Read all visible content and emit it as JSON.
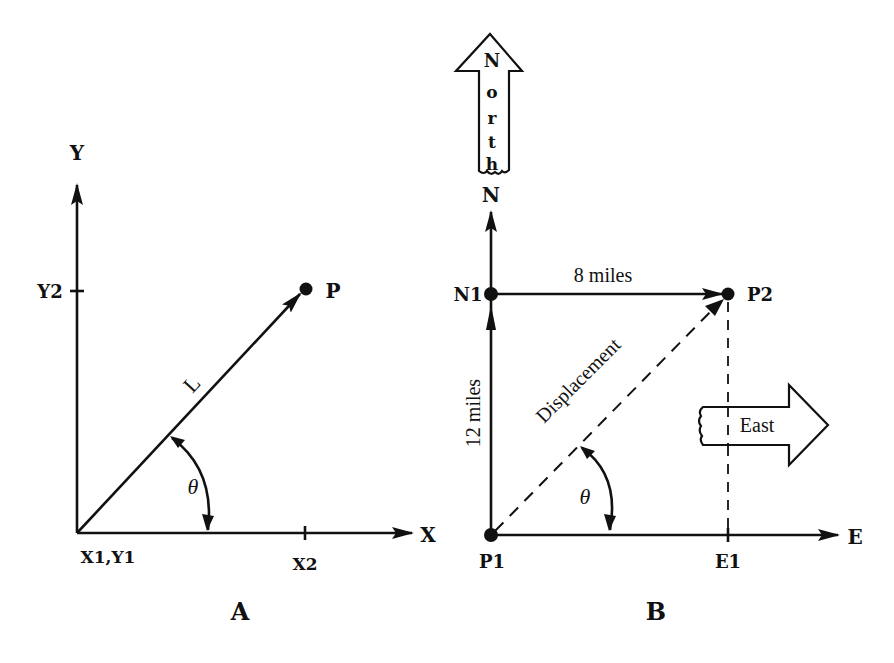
{
  "diagram_a": {
    "caption": "A",
    "axis_x_label": "X",
    "axis_y_label": "Y",
    "origin_label": "X1,Y1",
    "x2_label": "X2",
    "y2_label": "Y2",
    "point_label": "P",
    "vector_label": "L",
    "angle_label": "θ"
  },
  "diagram_b": {
    "caption": "B",
    "north_arrow_letters": [
      "N",
      "o",
      "r",
      "t",
      "h"
    ],
    "north_axis_label": "N",
    "east_axis_label": "E",
    "east_arrow_label": "East",
    "origin_label": "P1",
    "n1_label": "N1",
    "p2_label": "P2",
    "e1_label": "E1",
    "north_leg_label": "12 miles",
    "east_leg_label": "8 miles",
    "displacement_label": "Displacement",
    "angle_label": "θ"
  }
}
